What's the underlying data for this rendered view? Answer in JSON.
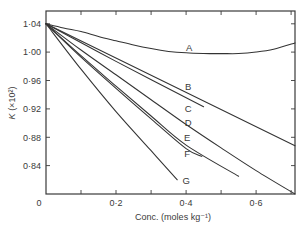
{
  "chart_data": {
    "type": "line",
    "title": "",
    "xlabel": "Conc. (moles kg⁻¹)",
    "ylabel": "K (×10²)",
    "ylabel_symbol": "K",
    "ylabel_unit": " (×10²)",
    "xlim": [
      0,
      0.711
    ],
    "ylim": [
      0.8,
      1.058
    ],
    "grid": false,
    "legend": "inline curve labels A-G",
    "xticks": [
      0.1,
      0.2,
      0.3,
      0.4,
      0.5,
      0.6,
      0.7
    ],
    "xtick_labels": [
      {
        "value": 0,
        "label": "0"
      },
      {
        "value": 0.2,
        "label": "0·2"
      },
      {
        "value": 0.4,
        "label": "0·4"
      },
      {
        "value": 0.6,
        "label": "0·6"
      }
    ],
    "yticks": [
      0.84,
      0.88,
      0.92,
      0.96,
      1.0,
      1.04
    ],
    "ytick_labels": [
      {
        "value": 0.84,
        "label": "0·84"
      },
      {
        "value": 0.88,
        "label": "0·88"
      },
      {
        "value": 0.92,
        "label": "0·92"
      },
      {
        "value": 0.96,
        "label": "0·96"
      },
      {
        "value": 1.0,
        "label": "1·00"
      },
      {
        "value": 1.04,
        "label": "1·04"
      }
    ],
    "series": [
      {
        "name": "A",
        "label_pos": [
          0.409,
          1.006
        ],
        "points": [
          [
            0,
            1.04
          ],
          [
            0.05,
            1.034
          ],
          [
            0.1,
            1.029
          ],
          [
            0.15,
            1.022
          ],
          [
            0.2,
            1.016
          ],
          [
            0.25,
            1.01
          ],
          [
            0.3,
            1.005
          ],
          [
            0.35,
            1.001
          ],
          [
            0.4,
            0.999
          ],
          [
            0.45,
            0.998
          ],
          [
            0.5,
            0.998
          ],
          [
            0.55,
            0.998
          ],
          [
            0.6,
            1.0
          ],
          [
            0.65,
            1.004
          ],
          [
            0.711,
            1.013
          ]
        ]
      },
      {
        "name": "B",
        "label_pos": [
          0.406,
          0.951
        ],
        "points": [
          [
            0,
            1.04
          ],
          [
            0.711,
            0.868
          ]
        ]
      },
      {
        "name": "C",
        "label_pos": [
          0.406,
          0.921
        ],
        "points": [
          [
            0,
            1.04
          ],
          [
            0.2,
            0.987
          ],
          [
            0.45,
            0.923
          ]
        ]
      },
      {
        "name": "D",
        "label_pos": [
          0.406,
          0.901
        ],
        "points": [
          [
            0,
            1.04
          ],
          [
            0.1,
            1.003
          ],
          [
            0.2,
            0.968
          ],
          [
            0.3,
            0.933
          ],
          [
            0.4,
            0.898
          ],
          [
            0.5,
            0.865
          ],
          [
            0.6,
            0.833
          ],
          [
            0.711,
            0.8
          ]
        ]
      },
      {
        "name": "E",
        "label_pos": [
          0.403,
          0.88
        ],
        "points": [
          [
            0,
            1.04
          ],
          [
            0.1,
            0.995
          ],
          [
            0.2,
            0.952
          ],
          [
            0.3,
            0.91
          ],
          [
            0.4,
            0.869
          ],
          [
            0.55,
            0.825
          ]
        ]
      },
      {
        "name": "F",
        "label_pos": [
          0.403,
          0.857
        ],
        "points": [
          [
            0,
            1.04
          ],
          [
            0.1,
            0.993
          ],
          [
            0.2,
            0.949
          ],
          [
            0.3,
            0.906
          ],
          [
            0.4,
            0.864
          ],
          [
            0.445,
            0.853
          ]
        ]
      },
      {
        "name": "G",
        "label_pos": [
          0.4,
          0.819
        ],
        "points": [
          [
            0,
            1.04
          ],
          [
            0.1,
            0.976
          ],
          [
            0.2,
            0.916
          ],
          [
            0.3,
            0.861
          ],
          [
            0.375,
            0.82
          ]
        ]
      }
    ]
  }
}
